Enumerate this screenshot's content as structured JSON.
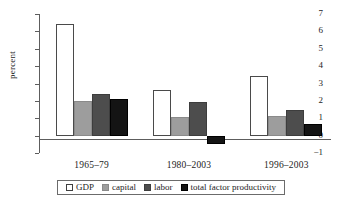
{
  "chart_data": {
    "type": "bar",
    "title": "",
    "xlabel": "",
    "ylabel": "percent",
    "ylim": [
      -1,
      7
    ],
    "yticks": [
      7,
      6,
      5,
      4,
      3,
      2,
      1,
      0,
      -1
    ],
    "ytick_labels": [
      "7",
      "6",
      "5",
      "4",
      "3",
      "2",
      "1",
      "0",
      "−1"
    ],
    "grid": false,
    "legend_position": "bottom",
    "categories": [
      "1965–79",
      "1980–2003",
      "1996–2003"
    ],
    "series": [
      {
        "name": "GDP",
        "color": "#ffffff",
        "values": [
          6.45,
          2.6,
          3.45
        ]
      },
      {
        "name": "capital",
        "color": "#9d9d9d",
        "values": [
          2.0,
          1.05,
          1.15
        ]
      },
      {
        "name": "labor",
        "color": "#4d4d4d",
        "values": [
          2.4,
          1.95,
          1.5
        ]
      },
      {
        "name": "total factor productivity",
        "color": "#141414",
        "values": [
          2.1,
          -0.5,
          0.65
        ]
      }
    ]
  }
}
